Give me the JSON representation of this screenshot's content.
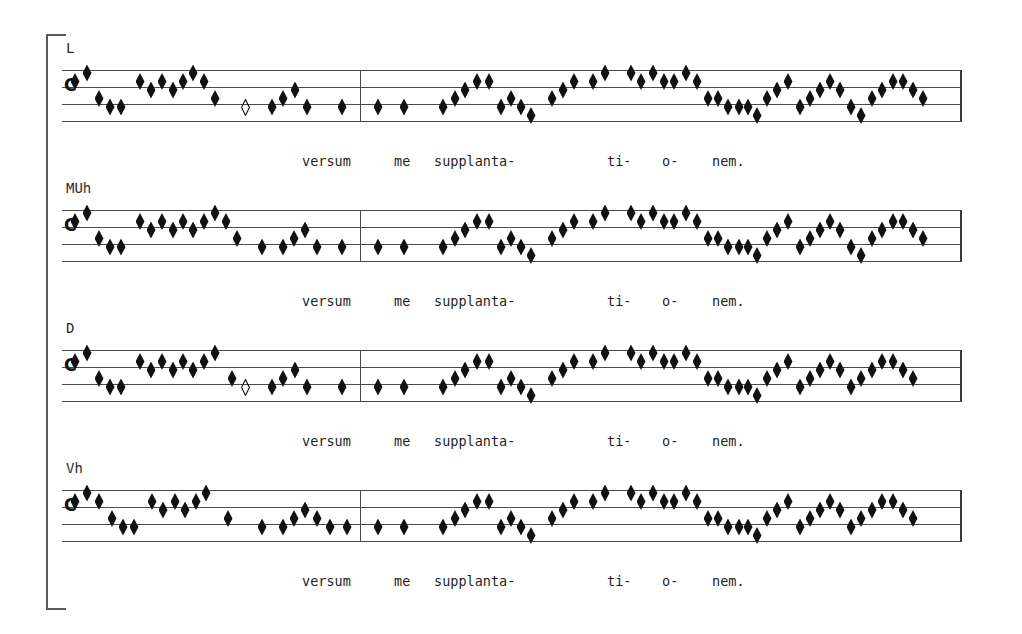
{
  "document": {
    "kind": "chant-transcription-comparison",
    "bracket": {
      "present": true
    },
    "clef_glyph": "C-clef",
    "staff_line_count": 4,
    "lyrics_line": "versum   me  supplanta-      ti-  o-  nem.",
    "lyric_syllables": [
      {
        "text": "versum",
        "x": 240
      },
      {
        "text": "me",
        "x": 332
      },
      {
        "text": "supplanta-",
        "x": 372
      },
      {
        "text": "ti-",
        "x": 545
      },
      {
        "text": "o-",
        "x": 600
      },
      {
        "text": "nem.",
        "x": 650
      }
    ]
  },
  "systems": [
    {
      "label": "L",
      "clef": "C",
      "has_open_note": true,
      "notes_left": [
        {
          "x": 75,
          "p": 5
        },
        {
          "x": 87,
          "p": 6
        },
        {
          "x": 99,
          "p": 3
        },
        {
          "x": 110,
          "p": 2
        },
        {
          "x": 121,
          "p": 2
        },
        {
          "x": 140,
          "p": 5
        },
        {
          "x": 151,
          "p": 4
        },
        {
          "x": 162,
          "p": 5
        },
        {
          "x": 173,
          "p": 4
        },
        {
          "x": 183,
          "p": 5
        },
        {
          "x": 193,
          "p": 6
        },
        {
          "x": 204,
          "p": 5
        },
        {
          "x": 215,
          "p": 3
        },
        {
          "x": 245,
          "p": 2,
          "open": true
        },
        {
          "x": 272,
          "p": 2
        },
        {
          "x": 283,
          "p": 3
        },
        {
          "x": 295,
          "p": 4
        },
        {
          "x": 307,
          "p": 2
        },
        {
          "x": 342,
          "p": 2
        }
      ],
      "notes_right": [
        {
          "x": 378,
          "p": 2
        },
        {
          "x": 404,
          "p": 2
        },
        {
          "x": 443,
          "p": 2
        },
        {
          "x": 455,
          "p": 3
        },
        {
          "x": 465,
          "p": 4
        },
        {
          "x": 477,
          "p": 5
        },
        {
          "x": 489,
          "p": 5
        },
        {
          "x": 501,
          "p": 2
        },
        {
          "x": 511,
          "p": 3
        },
        {
          "x": 521,
          "p": 2
        },
        {
          "x": 531,
          "p": 1
        },
        {
          "x": 552,
          "p": 3
        },
        {
          "x": 563,
          "p": 4
        },
        {
          "x": 574,
          "p": 5
        },
        {
          "x": 593,
          "p": 5
        },
        {
          "x": 605,
          "p": 6
        },
        {
          "x": 631,
          "p": 6
        },
        {
          "x": 641,
          "p": 5
        },
        {
          "x": 653,
          "p": 6
        },
        {
          "x": 664,
          "p": 5
        },
        {
          "x": 674,
          "p": 5
        },
        {
          "x": 686,
          "p": 6
        },
        {
          "x": 697,
          "p": 5
        },
        {
          "x": 708,
          "p": 3
        },
        {
          "x": 718,
          "p": 3
        },
        {
          "x": 728,
          "p": 2
        },
        {
          "x": 739,
          "p": 2
        },
        {
          "x": 748,
          "p": 2
        },
        {
          "x": 757,
          "p": 1
        },
        {
          "x": 767,
          "p": 3
        },
        {
          "x": 777,
          "p": 4
        },
        {
          "x": 788,
          "p": 5
        },
        {
          "x": 800,
          "p": 2
        },
        {
          "x": 810,
          "p": 3
        },
        {
          "x": 820,
          "p": 4
        },
        {
          "x": 830,
          "p": 5
        },
        {
          "x": 840,
          "p": 4
        },
        {
          "x": 851,
          "p": 2
        },
        {
          "x": 861,
          "p": 1
        },
        {
          "x": 872,
          "p": 3
        },
        {
          "x": 882,
          "p": 4
        },
        {
          "x": 893,
          "p": 5
        },
        {
          "x": 903,
          "p": 5
        },
        {
          "x": 913,
          "p": 4
        },
        {
          "x": 923,
          "p": 3
        }
      ]
    },
    {
      "label": "MUh",
      "clef": "C",
      "has_open_note": false,
      "notes_left": [
        {
          "x": 75,
          "p": 5
        },
        {
          "x": 87,
          "p": 6
        },
        {
          "x": 99,
          "p": 3
        },
        {
          "x": 110,
          "p": 2
        },
        {
          "x": 121,
          "p": 2
        },
        {
          "x": 140,
          "p": 5
        },
        {
          "x": 151,
          "p": 4
        },
        {
          "x": 162,
          "p": 5
        },
        {
          "x": 173,
          "p": 4
        },
        {
          "x": 183,
          "p": 5
        },
        {
          "x": 193,
          "p": 4
        },
        {
          "x": 204,
          "p": 5
        },
        {
          "x": 215,
          "p": 6
        },
        {
          "x": 226,
          "p": 5
        },
        {
          "x": 237,
          "p": 3
        },
        {
          "x": 262,
          "p": 2
        },
        {
          "x": 283,
          "p": 2
        },
        {
          "x": 294,
          "p": 3
        },
        {
          "x": 305,
          "p": 4
        },
        {
          "x": 317,
          "p": 2
        },
        {
          "x": 342,
          "p": 2
        }
      ],
      "notes_right": [
        {
          "x": 378,
          "p": 2
        },
        {
          "x": 404,
          "p": 2
        },
        {
          "x": 443,
          "p": 2
        },
        {
          "x": 455,
          "p": 3
        },
        {
          "x": 465,
          "p": 4
        },
        {
          "x": 477,
          "p": 5
        },
        {
          "x": 489,
          "p": 5
        },
        {
          "x": 501,
          "p": 2
        },
        {
          "x": 511,
          "p": 3
        },
        {
          "x": 521,
          "p": 2
        },
        {
          "x": 531,
          "p": 1
        },
        {
          "x": 552,
          "p": 3
        },
        {
          "x": 563,
          "p": 4
        },
        {
          "x": 574,
          "p": 5
        },
        {
          "x": 593,
          "p": 5
        },
        {
          "x": 605,
          "p": 6
        },
        {
          "x": 631,
          "p": 6
        },
        {
          "x": 641,
          "p": 5
        },
        {
          "x": 653,
          "p": 6
        },
        {
          "x": 664,
          "p": 5
        },
        {
          "x": 674,
          "p": 5
        },
        {
          "x": 686,
          "p": 6
        },
        {
          "x": 697,
          "p": 5
        },
        {
          "x": 708,
          "p": 3
        },
        {
          "x": 718,
          "p": 3
        },
        {
          "x": 728,
          "p": 2
        },
        {
          "x": 739,
          "p": 2
        },
        {
          "x": 748,
          "p": 2
        },
        {
          "x": 757,
          "p": 1
        },
        {
          "x": 767,
          "p": 3
        },
        {
          "x": 777,
          "p": 4
        },
        {
          "x": 788,
          "p": 5
        },
        {
          "x": 800,
          "p": 2
        },
        {
          "x": 810,
          "p": 3
        },
        {
          "x": 820,
          "p": 4
        },
        {
          "x": 830,
          "p": 5
        },
        {
          "x": 840,
          "p": 4
        },
        {
          "x": 851,
          "p": 2
        },
        {
          "x": 861,
          "p": 1
        },
        {
          "x": 872,
          "p": 3
        },
        {
          "x": 882,
          "p": 4
        },
        {
          "x": 893,
          "p": 5
        },
        {
          "x": 903,
          "p": 5
        },
        {
          "x": 913,
          "p": 4
        },
        {
          "x": 923,
          "p": 3
        }
      ]
    },
    {
      "label": "D",
      "clef": "C",
      "has_open_note": true,
      "notes_left": [
        {
          "x": 75,
          "p": 5
        },
        {
          "x": 87,
          "p": 6
        },
        {
          "x": 99,
          "p": 3
        },
        {
          "x": 110,
          "p": 2
        },
        {
          "x": 121,
          "p": 2
        },
        {
          "x": 140,
          "p": 5
        },
        {
          "x": 151,
          "p": 4
        },
        {
          "x": 162,
          "p": 5
        },
        {
          "x": 173,
          "p": 4
        },
        {
          "x": 183,
          "p": 5
        },
        {
          "x": 193,
          "p": 4
        },
        {
          "x": 204,
          "p": 5
        },
        {
          "x": 215,
          "p": 6
        },
        {
          "x": 232,
          "p": 3
        },
        {
          "x": 245,
          "p": 2,
          "open": true
        },
        {
          "x": 272,
          "p": 2
        },
        {
          "x": 283,
          "p": 3
        },
        {
          "x": 295,
          "p": 4
        },
        {
          "x": 307,
          "p": 2
        },
        {
          "x": 342,
          "p": 2
        }
      ],
      "notes_right": [
        {
          "x": 378,
          "p": 2
        },
        {
          "x": 404,
          "p": 2
        },
        {
          "x": 443,
          "p": 2
        },
        {
          "x": 455,
          "p": 3
        },
        {
          "x": 465,
          "p": 4
        },
        {
          "x": 477,
          "p": 5
        },
        {
          "x": 489,
          "p": 5
        },
        {
          "x": 501,
          "p": 2
        },
        {
          "x": 511,
          "p": 3
        },
        {
          "x": 521,
          "p": 2
        },
        {
          "x": 531,
          "p": 1
        },
        {
          "x": 552,
          "p": 3
        },
        {
          "x": 563,
          "p": 4
        },
        {
          "x": 574,
          "p": 5
        },
        {
          "x": 593,
          "p": 5
        },
        {
          "x": 605,
          "p": 6
        },
        {
          "x": 631,
          "p": 6
        },
        {
          "x": 641,
          "p": 5
        },
        {
          "x": 653,
          "p": 6
        },
        {
          "x": 664,
          "p": 5
        },
        {
          "x": 674,
          "p": 5
        },
        {
          "x": 686,
          "p": 6
        },
        {
          "x": 697,
          "p": 5
        },
        {
          "x": 708,
          "p": 3
        },
        {
          "x": 718,
          "p": 3
        },
        {
          "x": 728,
          "p": 2
        },
        {
          "x": 739,
          "p": 2
        },
        {
          "x": 748,
          "p": 2
        },
        {
          "x": 757,
          "p": 1
        },
        {
          "x": 767,
          "p": 3
        },
        {
          "x": 777,
          "p": 4
        },
        {
          "x": 788,
          "p": 5
        },
        {
          "x": 800,
          "p": 2
        },
        {
          "x": 810,
          "p": 3
        },
        {
          "x": 820,
          "p": 4
        },
        {
          "x": 830,
          "p": 5
        },
        {
          "x": 840,
          "p": 4
        },
        {
          "x": 851,
          "p": 2
        },
        {
          "x": 861,
          "p": 3
        },
        {
          "x": 872,
          "p": 4
        },
        {
          "x": 882,
          "p": 5
        },
        {
          "x": 893,
          "p": 5
        },
        {
          "x": 903,
          "p": 4
        },
        {
          "x": 913,
          "p": 3
        }
      ]
    },
    {
      "label": "Vh",
      "clef": "C",
      "has_open_note": false,
      "notes_left": [
        {
          "x": 75,
          "p": 5
        },
        {
          "x": 87,
          "p": 6
        },
        {
          "x": 99,
          "p": 5
        },
        {
          "x": 112,
          "p": 3
        },
        {
          "x": 123,
          "p": 2
        },
        {
          "x": 134,
          "p": 2
        },
        {
          "x": 152,
          "p": 5
        },
        {
          "x": 163,
          "p": 4
        },
        {
          "x": 175,
          "p": 5
        },
        {
          "x": 185,
          "p": 4
        },
        {
          "x": 196,
          "p": 5
        },
        {
          "x": 206,
          "p": 6
        },
        {
          "x": 228,
          "p": 3
        },
        {
          "x": 262,
          "p": 2
        },
        {
          "x": 283,
          "p": 2
        },
        {
          "x": 294,
          "p": 3
        },
        {
          "x": 305,
          "p": 4
        },
        {
          "x": 317,
          "p": 3
        },
        {
          "x": 330,
          "p": 2
        },
        {
          "x": 347,
          "p": 2
        }
      ],
      "notes_right": [
        {
          "x": 378,
          "p": 2
        },
        {
          "x": 404,
          "p": 2
        },
        {
          "x": 443,
          "p": 2
        },
        {
          "x": 455,
          "p": 3
        },
        {
          "x": 465,
          "p": 4
        },
        {
          "x": 477,
          "p": 5
        },
        {
          "x": 489,
          "p": 5
        },
        {
          "x": 501,
          "p": 2
        },
        {
          "x": 511,
          "p": 3
        },
        {
          "x": 521,
          "p": 2
        },
        {
          "x": 531,
          "p": 1
        },
        {
          "x": 552,
          "p": 3
        },
        {
          "x": 563,
          "p": 4
        },
        {
          "x": 574,
          "p": 5
        },
        {
          "x": 593,
          "p": 5
        },
        {
          "x": 605,
          "p": 6
        },
        {
          "x": 631,
          "p": 6
        },
        {
          "x": 641,
          "p": 5
        },
        {
          "x": 653,
          "p": 6
        },
        {
          "x": 664,
          "p": 5
        },
        {
          "x": 674,
          "p": 5
        },
        {
          "x": 686,
          "p": 6
        },
        {
          "x": 697,
          "p": 5
        },
        {
          "x": 708,
          "p": 3
        },
        {
          "x": 718,
          "p": 3
        },
        {
          "x": 728,
          "p": 2
        },
        {
          "x": 739,
          "p": 2
        },
        {
          "x": 748,
          "p": 2
        },
        {
          "x": 757,
          "p": 1
        },
        {
          "x": 767,
          "p": 3
        },
        {
          "x": 777,
          "p": 4
        },
        {
          "x": 788,
          "p": 5
        },
        {
          "x": 800,
          "p": 2
        },
        {
          "x": 810,
          "p": 3
        },
        {
          "x": 820,
          "p": 4
        },
        {
          "x": 830,
          "p": 5
        },
        {
          "x": 840,
          "p": 4
        },
        {
          "x": 851,
          "p": 2
        },
        {
          "x": 861,
          "p": 3
        },
        {
          "x": 872,
          "p": 4
        },
        {
          "x": 882,
          "p": 5
        },
        {
          "x": 893,
          "p": 5
        },
        {
          "x": 903,
          "p": 4
        },
        {
          "x": 913,
          "p": 3
        }
      ]
    }
  ],
  "layout": {
    "staff_left": 62,
    "staff_right": 962,
    "barline_x": 360,
    "line_gap": 17,
    "system_tops": [
      70,
      210,
      350,
      490
    ],
    "label_tops": [
      40,
      180,
      320,
      460
    ],
    "lyric_tops": [
      153,
      293,
      433,
      573
    ],
    "bracket": {
      "x": 46,
      "y": 34,
      "w": 18,
      "h": 572
    }
  },
  "colors": {
    "ink": "#111111",
    "staff": "#4a4a4a",
    "text": "#1e1e1e",
    "background": "#ffffff"
  }
}
